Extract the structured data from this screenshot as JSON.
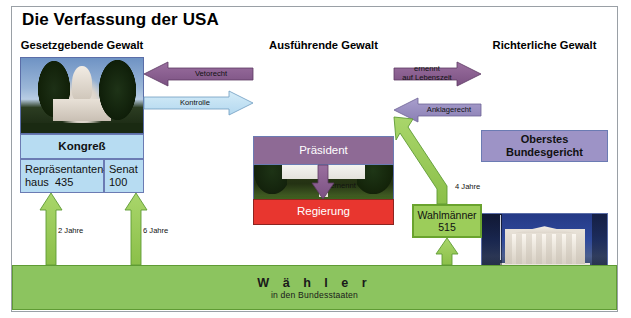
{
  "title": "Die Verfassung der USA",
  "branches": {
    "legislative": {
      "heading": "Gesetzgebende Gewalt",
      "photo_icon": "capitol-building-photo",
      "body_label": "Kongreß",
      "chambers": [
        {
          "name": "Repräsentanten-haus",
          "seats": "435",
          "term": "2 Jahre"
        },
        {
          "name": "Senat",
          "seats": "100",
          "term": "6 Jahre"
        }
      ]
    },
    "executive": {
      "heading": "Ausführende Gewalt",
      "photo_icon": "white-house-photo",
      "body_label": "Präsident",
      "appoints_label": "ernennt",
      "cabinet_label": "Regierung"
    },
    "judicial": {
      "heading": "Richterliche Gewalt",
      "photo_icon": "supreme-court-photo",
      "body_label_line1": "Oberstes",
      "body_label_line2": "Bundesgericht"
    }
  },
  "relations": {
    "veto": "Vetorecht",
    "control": "Kontrolle",
    "appoint_life_line1": "ernennt",
    "appoint_life_line2": "auf Lebenszeit",
    "impeach": "Anklagerecht",
    "electors_term": "4 Jahre"
  },
  "electors": {
    "label": "Wahlmänner",
    "count": "515"
  },
  "voters": {
    "main": "W ä h l e r",
    "sub": "in den Bundesstaaten"
  },
  "colors": {
    "legislative": "#b7dcf2",
    "executive": "#8e6a95",
    "judicial": "#9d93c6",
    "government": "#e8362f",
    "electoral": "#9ccd5a",
    "voters": "#8cc45f",
    "frame": "#9aa0a6"
  }
}
